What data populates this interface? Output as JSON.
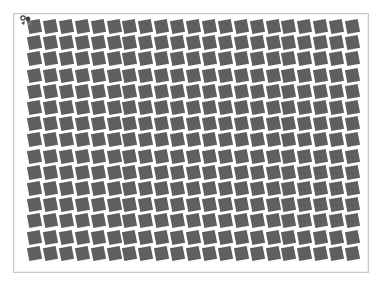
{
  "canvas": {
    "columns": 21,
    "rows": 15,
    "pitch_x": 15.9,
    "pitch_y": 16.2,
    "tile_size": 13,
    "tile_rotation_deg": -11,
    "tile_color": "#5f5f5f",
    "background": "#ffffff",
    "border_color": "#c8c8c8"
  },
  "icons": {
    "cursor": "move-cursor-icon"
  }
}
